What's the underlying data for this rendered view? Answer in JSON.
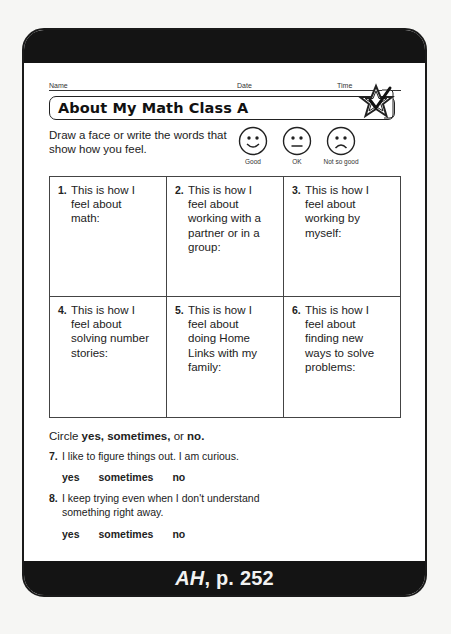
{
  "header": {
    "name_label": "Name",
    "date_label": "Date",
    "time_label": "Time",
    "title": "About My Math Class A",
    "title_icon": "star-check-icon"
  },
  "instructions": {
    "text": "Draw a face or write the words that show how you feel.",
    "faces": [
      {
        "icon": "smiley-face-icon",
        "label": "Good"
      },
      {
        "icon": "neutral-face-icon",
        "label": "OK"
      },
      {
        "icon": "frowning-face-icon",
        "label": "Not so good"
      }
    ]
  },
  "grid": {
    "cells": [
      {
        "num": "1.",
        "text": "This is how I\nfeel about\nmath:"
      },
      {
        "num": "2.",
        "text": "This is how I\nfeel about\nworking with a\npartner or in a\ngroup:"
      },
      {
        "num": "3.",
        "text": "This is how I\nfeel about\nworking by\nmyself:"
      },
      {
        "num": "4.",
        "text": "This is how I\nfeel about\nsolving number\nstories:"
      },
      {
        "num": "5.",
        "text": "This is how I\nfeel about\ndoing Home\nLinks with my\nfamily:"
      },
      {
        "num": "6.",
        "text": "This is how I\nfeel about\nfinding new\nways to solve\nproblems:"
      }
    ]
  },
  "circle_section": {
    "prefix": "Circle ",
    "yes": "yes,",
    "sometimes": " sometimes,",
    "or": " or ",
    "no": "no."
  },
  "questions": [
    {
      "num": "7.",
      "text": "I like to figure things out. I am curious.",
      "options": [
        "yes",
        "sometimes",
        "no"
      ]
    },
    {
      "num": "8.",
      "text": "I keep trying even when I don't understand\nsomething right away.",
      "options": [
        "yes",
        "sometimes",
        "no"
      ]
    }
  ],
  "footer": {
    "ref_italic": "AH",
    "ref_rest": ", p. 252"
  },
  "colors": {
    "band": "#141414",
    "paper": "#ffffff",
    "ink": "#222222"
  }
}
